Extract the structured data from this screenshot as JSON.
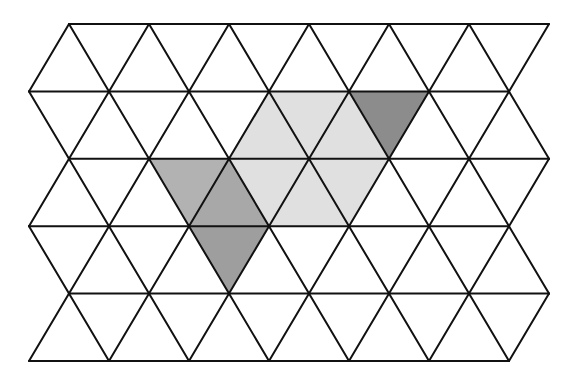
{
  "diagram": {
    "type": "triangular-grid",
    "background": "#ffffff",
    "line_color": "#111111",
    "line_width": 2,
    "rows_y": [
      24,
      91.4,
      158.8,
      226.2,
      293.6,
      361
    ],
    "even_row_x": [
      69,
      149,
      229,
      309,
      389,
      469,
      549
    ],
    "odd_row_x": [
      29,
      109,
      189,
      269,
      349,
      429,
      509
    ],
    "shaded_regions": [
      {
        "name": "light-hexagon",
        "fill": "#e0e0e0",
        "points": [
          [
            269,
            91.4
          ],
          [
            349,
            91.4
          ],
          [
            389,
            158.8
          ],
          [
            349,
            226.2
          ],
          [
            269,
            226.2
          ],
          [
            229,
            158.8
          ]
        ]
      },
      {
        "name": "dark-triangle-top-right",
        "fill": "#8c8c8c",
        "points": [
          [
            349,
            91.4
          ],
          [
            429,
            91.4
          ],
          [
            389,
            158.8
          ]
        ]
      },
      {
        "name": "medium-triangle-left-upper",
        "fill": "#b2b2b2",
        "points": [
          [
            149,
            158.8
          ],
          [
            229,
            158.8
          ],
          [
            189,
            226.2
          ]
        ]
      },
      {
        "name": "medium-triangle-left-middle",
        "fill": "#a8a8a8",
        "points": [
          [
            229,
            158.8
          ],
          [
            189,
            226.2
          ],
          [
            269,
            226.2
          ]
        ]
      },
      {
        "name": "medium-triangle-left-lower",
        "fill": "#9e9e9e",
        "points": [
          [
            189,
            226.2
          ],
          [
            269,
            226.2
          ],
          [
            229,
            293.6
          ]
        ]
      }
    ]
  }
}
